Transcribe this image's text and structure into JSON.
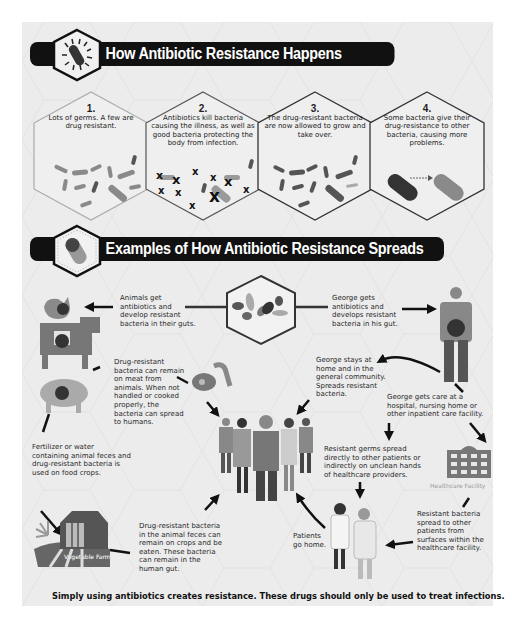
{
  "section1": {
    "title": "How Antibiotic Resistance Happens",
    "icon": "bacterium-icon",
    "steps": [
      {
        "number": "1.",
        "text": "Lots of germs. A few are drug resistant."
      },
      {
        "number": "2.",
        "text": "Antibiotics kill bacteria causing the illness, as well as good bacteria protecting the body from infection."
      },
      {
        "number": "3.",
        "text": "The drug-resistant bacteria are now allowed to grow and take over."
      },
      {
        "number": "4.",
        "text": "Some bacteria give their drug-resistance to other bacteria, causing more problems."
      }
    ]
  },
  "section2": {
    "title": "Examples of How Antibiotic Resistance Spreads",
    "icon": "pill-capsule-icon",
    "texts": {
      "animals_get": "Animals get antibiotics and develop resistant bacteria in their guts.",
      "george_gets": "George gets antibiotics and develops resistant bacteria in his gut.",
      "meat": "Drug-resistant bacteria can remain on meat from animals. When not handled or cooked properly, the bacteria can spread to humans.",
      "george_home": "George stays at home and in the general community. Spreads resistant bacteria.",
      "george_care": "George gets care at a hospital, nursing home or other inpatient care facility.",
      "fertilizer": "Fertilizer or water containing animal feces and drug-resistant bacteria is used on food crops.",
      "germs_spread": "Resistant germs spread directly to other patients or indirectly on unclean hands of healthcare providers.",
      "crops": "Drug-resistant bacteria in the animal feces can remain on crops and be eaten. These bacteria can remain in the human gut.",
      "patients_home": "Patients go home.",
      "surfaces": "Resistant bacteria spread to other patients from surfaces within the healthcare facility."
    },
    "labels": {
      "healthcare_facility": "Healthcare Facility",
      "vegetable_farm": "Vegetable Farm"
    }
  },
  "footer": "Simply using antibiotics creates resistance.  These drugs should only be used to treat infections.",
  "colors": {
    "panel": "#ececec",
    "banner": "#111111",
    "bacteria_dark": "#555555",
    "bacteria_light": "#9a9a9a",
    "figure_gray": "#6f6f6f"
  }
}
